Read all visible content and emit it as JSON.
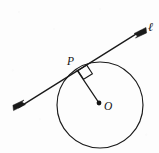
{
  "figure": {
    "title": "Tangent line to a circle at point P",
    "background_color": "#fdfdfd",
    "ink_color": "#1a1a1a",
    "width": 159,
    "height": 153,
    "labels": {
      "point_p": "P",
      "center_o": "O",
      "line_l": "ℓ"
    },
    "geometry": {
      "circle": {
        "center_x": 100,
        "center_y": 105,
        "radius": 43,
        "stroke_width": 1.15
      },
      "center_dot": {
        "cx": 99,
        "cy": 103,
        "r": 2.3
      },
      "tangent_point": {
        "x": 76.5,
        "y": 69.5
      },
      "tangent_line": {
        "x1": 14,
        "y1": 110,
        "x2": 145,
        "y2": 28,
        "stroke_width": 1.35,
        "arrow_both_ends": true
      },
      "radius_segment": {
        "x1": 76.5,
        "y1": 69.5,
        "x2": 99,
        "y2": 103,
        "stroke_width": 1.2
      },
      "right_angle_marker": {
        "size": 11,
        "vertex_x": 76.5,
        "vertex_y": 69.5
      }
    },
    "label_positions": {
      "point_p": {
        "x": 67,
        "y": 65
      },
      "center_o": {
        "x": 104,
        "y": 110
      },
      "line_l": {
        "x": 148,
        "y": 31
      }
    }
  }
}
